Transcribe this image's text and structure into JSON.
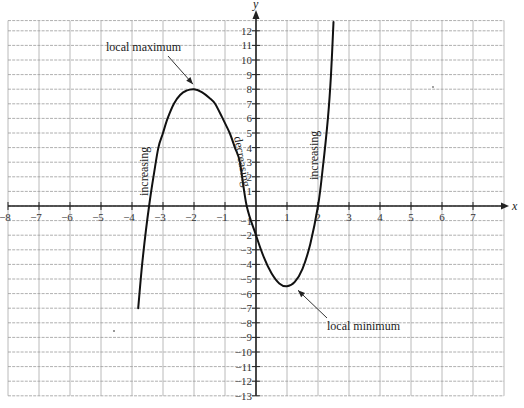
{
  "chart_data": {
    "type": "line",
    "title": "",
    "xlabel": "x",
    "ylabel": "y",
    "xlim": [
      -8,
      8
    ],
    "ylim": [
      -13,
      13
    ],
    "grid": true,
    "x_ticks": [
      -8,
      -7,
      -6,
      -5,
      -4,
      -3,
      -2,
      -1,
      1,
      2,
      3,
      4,
      5,
      6,
      7
    ],
    "y_ticks": [
      12,
      11,
      10,
      9,
      8,
      7,
      6,
      5,
      4,
      3,
      2,
      1,
      -1,
      -2,
      -3,
      -4,
      -5,
      -6,
      -7,
      -8,
      -9,
      -10,
      -11,
      -12,
      -13
    ],
    "series": [
      {
        "name": "f(x)",
        "x": [
          -3.8,
          -3.65,
          -3.45,
          -3.3,
          -3.15,
          -3.0,
          -2.85,
          -2.65,
          -2.45,
          -2.25,
          -2.0,
          -1.75,
          -1.5,
          -1.32,
          -1.1,
          -0.85,
          -0.68,
          -0.52,
          -0.3,
          0.0,
          0.25,
          0.5,
          0.75,
          1.0,
          1.25,
          1.5,
          1.75,
          2.0,
          2.15,
          2.32,
          2.42,
          2.5
        ],
        "y": [
          -7.0,
          -3.5,
          0.0,
          2.1,
          4.0,
          5.0,
          6.0,
          7.0,
          7.6,
          7.9,
          8.0,
          7.8,
          7.4,
          7.0,
          6.1,
          5.0,
          4.0,
          3.0,
          0.0,
          -2.0,
          -3.5,
          -4.6,
          -5.3,
          -5.5,
          -5.2,
          -4.3,
          -2.6,
          0.0,
          2.5,
          6.0,
          9.0,
          12.6
        ]
      }
    ],
    "annotations": [
      {
        "text": "local maximum",
        "points_to": [
          -2,
          8
        ]
      },
      {
        "text": "local minimum",
        "points_to": [
          1,
          -5.5
        ]
      },
      {
        "text": "increasing",
        "near": [
          -3.4,
          2.5
        ],
        "rotated": true
      },
      {
        "text": "decreasing",
        "near": [
          -0.5,
          3.5
        ],
        "rotated": true
      },
      {
        "text": "increasing",
        "near": [
          1.9,
          4.5
        ],
        "rotated": true
      }
    ]
  }
}
